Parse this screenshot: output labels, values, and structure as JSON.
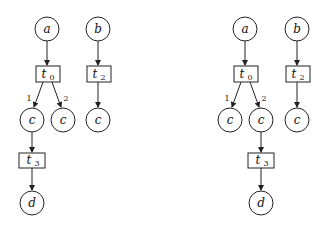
{
  "diagrams": [
    {
      "name": "left-net",
      "places": [
        {
          "id": "a",
          "label": "a",
          "cx": 47,
          "cy": 29
        },
        {
          "id": "b",
          "label": "b",
          "cx": 98,
          "cy": 29
        },
        {
          "id": "c1",
          "label": "c",
          "cx": 32,
          "cy": 120
        },
        {
          "id": "c2",
          "label": "c",
          "cx": 63,
          "cy": 120
        },
        {
          "id": "c3",
          "label": "c",
          "cx": 97,
          "cy": 120
        },
        {
          "id": "d",
          "label": "d",
          "cx": 32,
          "cy": 203
        }
      ],
      "transitions": [
        {
          "id": "t0",
          "label": "t",
          "sub": "0",
          "x": 36,
          "y": 66,
          "w": 24,
          "h": 16
        },
        {
          "id": "t2",
          "label": "t",
          "sub": "2",
          "x": 87,
          "y": 66,
          "w": 24,
          "h": 16
        },
        {
          "id": "t3",
          "label": "t",
          "sub": "3",
          "x": 19,
          "y": 153,
          "w": 26,
          "h": 15
        }
      ],
      "arc_labels": [
        {
          "text": "1",
          "x": 25,
          "y": 100
        },
        {
          "text": "2",
          "x": 64,
          "y": 100
        }
      ]
    },
    {
      "name": "right-net",
      "places": [
        {
          "id": "a",
          "label": "a",
          "cx": 245,
          "cy": 29
        },
        {
          "id": "b",
          "label": "b",
          "cx": 296,
          "cy": 29
        },
        {
          "id": "c1",
          "label": "c",
          "cx": 230,
          "cy": 120
        },
        {
          "id": "c2",
          "label": "c",
          "cx": 261,
          "cy": 120
        },
        {
          "id": "c3",
          "label": "c",
          "cx": 296,
          "cy": 120
        },
        {
          "id": "d",
          "label": "d",
          "cx": 261,
          "cy": 203
        }
      ],
      "transitions": [
        {
          "id": "t0",
          "label": "t",
          "sub": "0",
          "x": 234,
          "y": 66,
          "w": 24,
          "h": 16
        },
        {
          "id": "t2",
          "label": "t",
          "sub": "2",
          "x": 285,
          "y": 66,
          "w": 24,
          "h": 16
        },
        {
          "id": "t3",
          "label": "t",
          "sub": "3",
          "x": 248,
          "y": 153,
          "w": 26,
          "h": 15
        }
      ],
      "arc_labels": [
        {
          "text": "1",
          "x": 223,
          "y": 100
        },
        {
          "text": "2",
          "x": 262,
          "y": 100
        }
      ]
    }
  ],
  "labels": {
    "left": {
      "a": "a",
      "b": "b",
      "t0": "t",
      "t0s": "0",
      "t2": "t",
      "t2s": "2",
      "c1": "c",
      "c2": "c",
      "c3": "c",
      "t3": "t",
      "t3s": "3",
      "d": "d",
      "arc1": "1",
      "arc2": "2"
    },
    "right": {
      "a": "a",
      "b": "b",
      "t0": "t",
      "t0s": "0",
      "t2": "t",
      "t2s": "2",
      "c1": "c",
      "c2": "c",
      "c3": "c",
      "t3": "t",
      "t3s": "3",
      "d": "d",
      "arc1": "1",
      "arc2": "2"
    }
  }
}
